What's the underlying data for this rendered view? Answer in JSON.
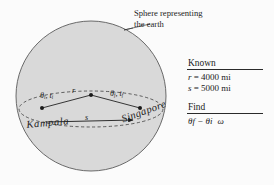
{
  "figure": {
    "type": "geometry-diagram",
    "colors": {
      "background": "#fbfbfb",
      "sphere_fill": "#d8d8d8",
      "sphere_stroke": "#555555",
      "equator_dash": "#444444",
      "line": "#222222",
      "text": "#1d1d1d"
    },
    "annotation": {
      "sphere_note": "Sphere representing the earth",
      "leader_line": "leader from note to sphere edge"
    },
    "labels": {
      "theta_initial": "θ",
      "theta_initial_sub": "i",
      "time_initial": "t",
      "time_initial_sub": "i",
      "theta_final": "θ",
      "theta_final_sub": "f",
      "time_final": "t",
      "time_final_sub": "f",
      "radius": "r",
      "arc": "s"
    },
    "label_theta_i_text": "θi, ti",
    "label_theta_f_text": "θf, tf",
    "cities": {
      "origin": "Kampala",
      "destination": "Singapore"
    }
  },
  "panel": {
    "known": {
      "heading": "Known",
      "lines": [
        {
          "symbol": "r",
          "value": "= 4000 mi"
        },
        {
          "symbol": "s",
          "value": "= 5000 mi"
        }
      ]
    },
    "find": {
      "heading": "Find",
      "expression": "θf − θi",
      "extra_symbol": "ω"
    }
  }
}
